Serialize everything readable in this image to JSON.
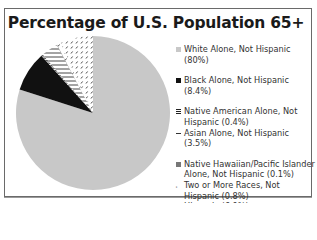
{
  "chart_data": {
    "type": "pie",
    "title": "Percentage of U.S. Population 65+",
    "legend_position": "right",
    "slices": [
      {
        "label": "White Alone, Not Hispanic",
        "value": 80,
        "display": "White Alone, Not Hispanic (80%)",
        "fill": "#c8c8c8",
        "pattern": "solid-gray"
      },
      {
        "label": "Black Alone, Not Hispanic",
        "value": 8.4,
        "display": "Black Alone, Not Hispanic (8.4%)",
        "fill": "#111111",
        "pattern": "solid-black"
      },
      {
        "label": "Native American Alone, Not Hispanic",
        "value": 0.4,
        "display_1": "Native American Alone, Not",
        "display_2": "Hispanic (0.4%)",
        "fill": "#555555",
        "pattern": "horizontal-lines-dark"
      },
      {
        "label": "Asian Alone, Not Hispanic",
        "value": 3.5,
        "display": "Asian Alone, Not Hispanic (3.5%)",
        "fill": "#ffffff",
        "pattern": "horizontal-lines"
      },
      {
        "label": "Native Hawaiian/Pacific Islander Alone, Not Hispanic",
        "value": 0.1,
        "display_1": "Native Hawaiian/Pacific Islander",
        "display_2": "Alone, Not Hispanic (0.1%)",
        "fill": "#777777",
        "pattern": "solid-dark-gray"
      },
      {
        "label": "Two or More Races, Not Hispanic",
        "value": 0.8,
        "display_1": "Two or More Races, Not",
        "display_2": "Hispanic (0.8%)",
        "fill": "#ffffff",
        "pattern": "sparse-dashes"
      },
      {
        "label": "Hispanic",
        "value": 6.9,
        "display": "Hispanic (6.9%)",
        "fill": "#ffffff",
        "pattern": "dense-dashes"
      }
    ]
  }
}
